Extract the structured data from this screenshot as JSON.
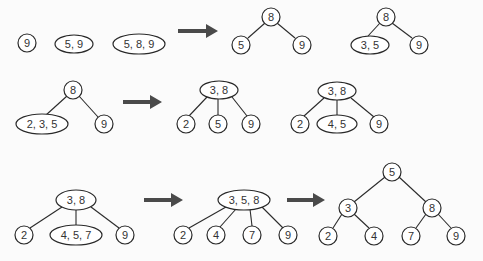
{
  "colors": {
    "node_stroke": "#2a2a2a",
    "arrow": "#4a4a4a",
    "background": "#fbfbfb"
  },
  "row1": {
    "steps": [
      {
        "keys": "9"
      },
      {
        "keys": "5, 9"
      },
      {
        "keys": "5, 8, 9"
      }
    ],
    "tree_a": {
      "root": "8",
      "children": [
        "5",
        "9"
      ]
    },
    "tree_b": {
      "root": "8",
      "children": [
        "3, 5",
        "9"
      ]
    }
  },
  "row2": {
    "tree_a": {
      "root": "8",
      "children": [
        "2, 3, 5",
        "9"
      ]
    },
    "tree_b": {
      "root": "3, 8",
      "children": [
        "2",
        "5",
        "9"
      ]
    },
    "tree_c": {
      "root": "3, 8",
      "children": [
        "2",
        "4, 5",
        "9"
      ]
    }
  },
  "row3": {
    "tree_a": {
      "root": "3, 8",
      "children": [
        "2",
        "4, 5, 7",
        "9"
      ]
    },
    "tree_b": {
      "root": "3, 5, 8",
      "children": [
        "2",
        "4",
        "7",
        "9"
      ]
    },
    "tree_c": {
      "root": "5",
      "children": [
        "3",
        "8"
      ],
      "grandchildren": [
        "2",
        "4",
        "7",
        "9"
      ]
    }
  }
}
